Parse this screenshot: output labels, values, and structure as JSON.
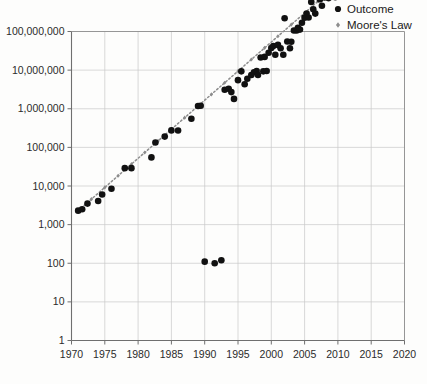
{
  "legend": {
    "position": "top-right",
    "entries": [
      {
        "label": "Outcome",
        "marker": "circle",
        "color": "#111111"
      },
      {
        "label": "Moore's Law",
        "marker": "small-diamond",
        "color": "#8d8d8d"
      }
    ]
  },
  "chart_data": {
    "type": "scatter",
    "title": "",
    "subtitle": "",
    "xlabel": "",
    "ylabel": "",
    "yscale": "log",
    "xscale": "linear",
    "grid": true,
    "xlim": [
      1970,
      2020
    ],
    "ylim": [
      1,
      100000000
    ],
    "xticks": [
      1970,
      1975,
      1980,
      1985,
      1990,
      1995,
      2000,
      2005,
      2010,
      2015,
      2020
    ],
    "xtick_labels": [
      "1970",
      "1975",
      "1980",
      "1985",
      "1990",
      "1995",
      "2000",
      "2005",
      "2010",
      "2015",
      "2020"
    ],
    "yticks": [
      1,
      10,
      100,
      1000,
      10000,
      100000,
      1000000,
      10000000,
      100000000
    ],
    "ytick_labels": [
      "1",
      "10",
      "100",
      "1,000",
      "10,000",
      "100,000",
      "1,000,000",
      "10,000,000",
      "100,000,000"
    ],
    "series": [
      {
        "name": "Outcome",
        "marker": "circle",
        "color": "#111111",
        "points": [
          [
            1971.0,
            2300
          ],
          [
            1971.6,
            2500
          ],
          [
            1972.4,
            3500
          ],
          [
            1974.0,
            4100
          ],
          [
            1974.6,
            6000
          ],
          [
            1976.0,
            8500
          ],
          [
            1978.0,
            29000
          ],
          [
            1979.0,
            29000
          ],
          [
            1982.0,
            55000
          ],
          [
            1982.6,
            134000
          ],
          [
            1984.0,
            190000
          ],
          [
            1985.0,
            275000
          ],
          [
            1986.0,
            273000
          ],
          [
            1988.0,
            550000
          ],
          [
            1989.0,
            1180000
          ],
          [
            1989.4,
            1200000
          ],
          [
            1990.0,
            110
          ],
          [
            1991.5,
            100
          ],
          [
            1992.5,
            120
          ],
          [
            1993.0,
            3100000
          ],
          [
            1993.6,
            3300000
          ],
          [
            1994.0,
            2700000
          ],
          [
            1994.4,
            1800000
          ],
          [
            1995.0,
            5500000
          ],
          [
            1995.5,
            9300000
          ],
          [
            1996.0,
            4300000
          ],
          [
            1996.4,
            6000000
          ],
          [
            1997.0,
            7500000
          ],
          [
            1997.4,
            8800000
          ],
          [
            1997.8,
            9500000
          ],
          [
            1998.0,
            7500000
          ],
          [
            1998.4,
            21300000
          ],
          [
            1998.8,
            9300000
          ],
          [
            1999.0,
            22000000
          ],
          [
            1999.3,
            9500000
          ],
          [
            1999.6,
            28100000
          ],
          [
            2000.0,
            37500000
          ],
          [
            2000.3,
            42000000
          ],
          [
            2000.6,
            25000000
          ],
          [
            2001.0,
            45000000
          ],
          [
            2001.4,
            37000000
          ],
          [
            2001.8,
            25000000
          ],
          [
            2002.0,
            220000000
          ],
          [
            2002.4,
            55000000
          ],
          [
            2002.8,
            37000000
          ],
          [
            2003.0,
            54300000
          ],
          [
            2003.4,
            105900000
          ],
          [
            2003.8,
            106000000
          ],
          [
            2004.0,
            125000000
          ],
          [
            2004.3,
            112000000
          ],
          [
            2004.6,
            169000000
          ],
          [
            2005.0,
            228000000
          ],
          [
            2005.3,
            291000000
          ],
          [
            2005.6,
            230000000
          ],
          [
            2006.0,
            582000000
          ],
          [
            2006.3,
            376000000
          ],
          [
            2006.6,
            291000000
          ],
          [
            2007.0,
            789000000
          ],
          [
            2007.3,
            681000000
          ],
          [
            2007.6,
            463000000
          ],
          [
            2008.0,
            758000000
          ],
          [
            2008.3,
            820000000
          ],
          [
            2008.6,
            731000000
          ],
          [
            2009.0,
            904000000
          ],
          [
            2009.3,
            1170000000
          ],
          [
            2009.6,
            774000000
          ],
          [
            2010.0,
            1170000000
          ],
          [
            2010.3,
            2300000000
          ],
          [
            2010.6,
            1400000000
          ],
          [
            2011.0,
            2600000000
          ],
          [
            2011.3,
            1160000000
          ],
          [
            2011.6,
            1750000000
          ],
          [
            2012.0,
            3100000000
          ],
          [
            2012.3,
            1400000000
          ],
          [
            2012.6,
            5000000000
          ],
          [
            2013.0,
            4310000000
          ],
          [
            2013.3,
            1860000000
          ],
          [
            2013.6,
            2100000000
          ],
          [
            2014.0,
            5560000000
          ],
          [
            2014.3,
            4310000000
          ],
          [
            2014.6,
            3200000000
          ],
          [
            2015.0,
            8000000000
          ],
          [
            2015.3,
            5700000000
          ],
          [
            2015.6,
            3300000000
          ],
          [
            2016.0,
            7200000000
          ],
          [
            2016.3,
            15300000000
          ],
          [
            2016.6,
            8000000000
          ],
          [
            2017.0,
            19200000000
          ],
          [
            2017.4,
            8000000000
          ],
          [
            2018.0,
            23600000000
          ],
          [
            2018.4,
            10000000000
          ],
          [
            2019.0,
            39540000000
          ]
        ]
      },
      {
        "name": "Moore's Law",
        "marker": "small-diamond",
        "color": "#8d8d8d",
        "description": "doubling every two years trend line",
        "line": true,
        "points": [
          [
            1971.0,
            2300
          ],
          [
            1973.0,
            4600
          ],
          [
            1975.0,
            9200
          ],
          [
            1977.0,
            18400
          ],
          [
            1979.0,
            36800
          ],
          [
            1981.0,
            73600
          ],
          [
            1983.0,
            147200
          ],
          [
            1985.0,
            294400
          ],
          [
            1987.0,
            588800
          ],
          [
            1989.0,
            1177600
          ],
          [
            1991.0,
            2355200
          ],
          [
            1993.0,
            4710400
          ],
          [
            1995.0,
            9420800
          ],
          [
            1997.0,
            18841600
          ],
          [
            1999.0,
            37683200
          ],
          [
            2001.0,
            75366400
          ],
          [
            2003.0,
            150732800
          ],
          [
            2005.0,
            301465600
          ],
          [
            2007.0,
            602931200
          ],
          [
            2009.0,
            1205862400
          ],
          [
            2011.0,
            2411724800
          ],
          [
            2013.0,
            4823449600
          ],
          [
            2015.0,
            9646899200
          ],
          [
            2017.0,
            19293798400
          ],
          [
            2019.0,
            38587596800
          ]
        ]
      }
    ]
  }
}
